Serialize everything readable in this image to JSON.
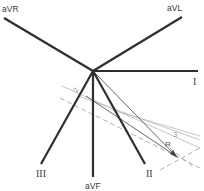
{
  "diagram": {
    "leads": [
      {
        "id": "aVR",
        "label": "aVR"
      },
      {
        "id": "aVL",
        "label": "aVL"
      },
      {
        "id": "I",
        "label": "I"
      },
      {
        "id": "II",
        "label": "II"
      },
      {
        "id": "III",
        "label": "III"
      },
      {
        "id": "aVF",
        "label": "aVF"
      }
    ],
    "annotations": {
      "line2": "2",
      "line3": "3",
      "vector": "R"
    },
    "colors": {
      "lead_line": "#2e2e2e",
      "construction_line": "#b8b8b8",
      "dashed_line": "#9a9a9a"
    }
  }
}
